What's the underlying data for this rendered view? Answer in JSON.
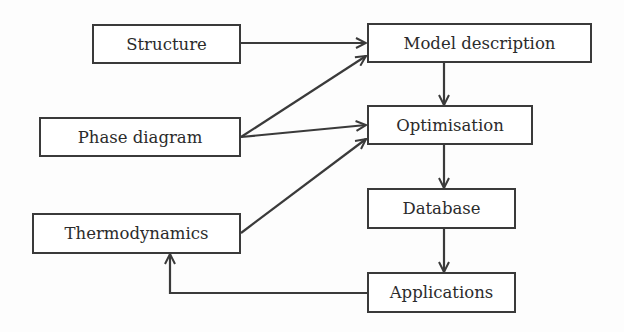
{
  "diagram": {
    "type": "flowchart",
    "colors": {
      "stroke": "#3a3a3a",
      "text": "#2b2b2b",
      "background": "#fdfdfd"
    },
    "nodes": {
      "structure": {
        "label": "Structure"
      },
      "phase_diagram": {
        "label": "Phase diagram"
      },
      "thermodynamics": {
        "label": "Thermodynamics"
      },
      "model_description": {
        "label": "Model description"
      },
      "optimisation": {
        "label": "Optimisation"
      },
      "database": {
        "label": "Database"
      },
      "applications": {
        "label": "Applications"
      }
    },
    "edges": [
      {
        "from": "Structure",
        "to": "Model description"
      },
      {
        "from": "Phase diagram",
        "to": "Model description"
      },
      {
        "from": "Phase diagram",
        "to": "Optimisation"
      },
      {
        "from": "Thermodynamics",
        "to": "Optimisation"
      },
      {
        "from": "Model description",
        "to": "Optimisation"
      },
      {
        "from": "Optimisation",
        "to": "Database"
      },
      {
        "from": "Database",
        "to": "Applications"
      },
      {
        "from": "Applications",
        "to": "Thermodynamics"
      }
    ]
  }
}
